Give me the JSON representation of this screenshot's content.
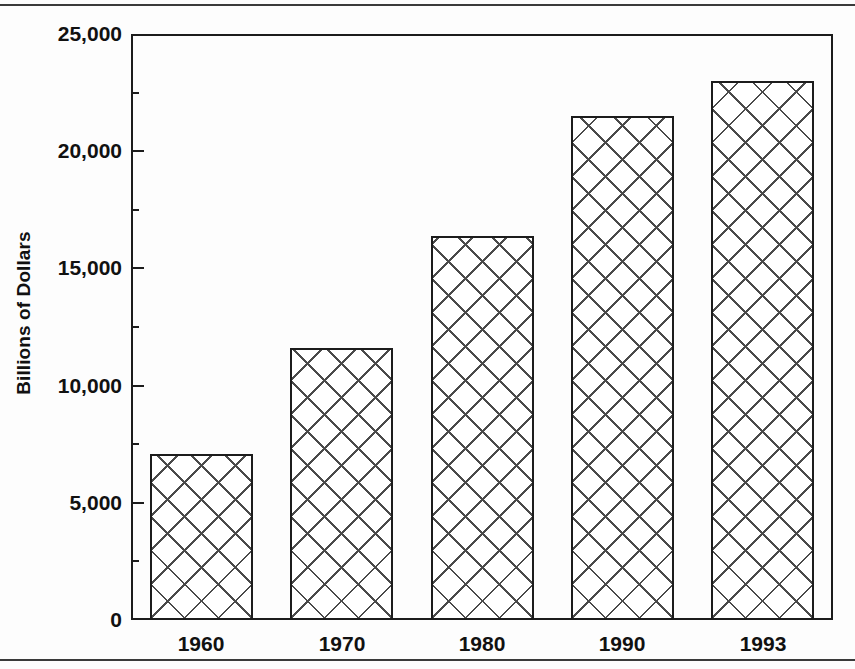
{
  "chart_data": {
    "type": "bar",
    "title": "",
    "subtitle": "",
    "xlabel": "",
    "ylabel": "Billions of Dollars",
    "categories": [
      "1960",
      "1970",
      "1980",
      "1990",
      "1993"
    ],
    "values": [
      7100,
      11600,
      16400,
      21500,
      23000
    ],
    "series": [
      {
        "name": "Billions of Dollars",
        "values": [
          7100,
          11600,
          16400,
          21500,
          23000
        ]
      }
    ],
    "ylim": [
      0,
      25000
    ],
    "y_major_ticks": [
      0,
      5000,
      10000,
      15000,
      20000,
      25000
    ],
    "y_tick_labels": [
      "0",
      "5,000",
      "10,000",
      "15,000",
      "20,000",
      "25,000"
    ],
    "y_minor_ticks": [
      2500,
      7500,
      12500,
      17500,
      22500
    ],
    "grid": false,
    "legend": false,
    "legend_position": "none",
    "bar_fill": "crosshatch",
    "annotations": []
  },
  "figure": {
    "frame_color": "#1c1c1c",
    "background": "#fdfdfd",
    "rule_color": "#3a3a3a",
    "hatch_color": "#4a4a4a"
  }
}
